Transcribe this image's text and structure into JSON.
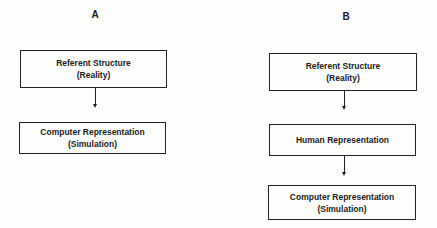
{
  "diagram_a": {
    "label": "A",
    "boxes": [
      {
        "line1": "Referent Structure",
        "line2": "(Reality)"
      },
      {
        "line1": "Computer Representation",
        "line2": "(Simulation)"
      }
    ]
  },
  "diagram_b": {
    "label": "B",
    "boxes": [
      {
        "line1": "Referent Structure",
        "line2": "(Reality)"
      },
      {
        "line1": "Human Representation"
      },
      {
        "line1": "Computer Representation",
        "line2": "(Simulation)"
      }
    ]
  }
}
